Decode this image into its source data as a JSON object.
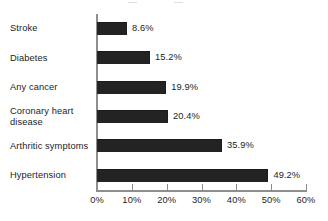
{
  "chart_data": {
    "type": "bar",
    "orientation": "horizontal",
    "title": "",
    "xlabel": "",
    "ylabel": "",
    "xlim": [
      0,
      60
    ],
    "grid": false,
    "legend": null,
    "unit": "%",
    "categories": [
      "Stroke",
      "Diabetes",
      "Any cancer",
      "Coronary heart disease",
      "Arthritic symptoms",
      "Hypertension"
    ],
    "values": [
      8.6,
      15.2,
      19.9,
      20.4,
      35.9,
      49.2
    ],
    "value_labels": [
      "8.6%",
      "15.2%",
      "19.9%",
      "20.4%",
      "35.9%",
      "49.2%"
    ],
    "x_ticks": [
      0,
      10,
      20,
      30,
      40,
      50,
      60
    ],
    "x_tick_labels": [
      "0%",
      "10%",
      "20%",
      "30%",
      "40%",
      "50%",
      "60%"
    ],
    "bar_color": "#232323",
    "axis_color": "#8e8e8e",
    "text_color": "#1d1d1d",
    "background_color": "#ffffff"
  }
}
